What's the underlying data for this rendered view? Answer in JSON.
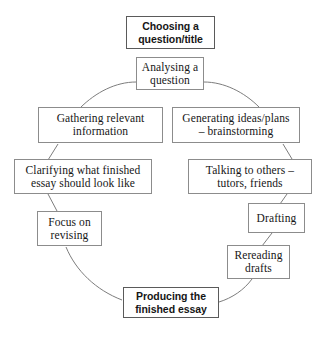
{
  "diagram": {
    "type": "cycle-flowchart",
    "background_color": "#ffffff",
    "box_border_color": "#8c8c8c",
    "arc_color": "#7d7d7d",
    "text_color": "#161616",
    "nodes": [
      {
        "id": "choosing-question-title",
        "label": "Choosing a\nquestion/title",
        "emphasis": true,
        "order": 1
      },
      {
        "id": "analysing-question",
        "label": "Analysing a\nquestion",
        "emphasis": false,
        "order": 2
      },
      {
        "id": "gathering-relevant-information",
        "label": "Gathering relevant\ninformation",
        "emphasis": false,
        "order": 3
      },
      {
        "id": "generating-ideas-plans",
        "label": "Generating ideas/plans\n– brainstorming",
        "emphasis": false,
        "order": 4
      },
      {
        "id": "clarifying-finished-essay",
        "label": "Clarifying what finished\nessay should look like",
        "emphasis": false,
        "order": 5
      },
      {
        "id": "talking-to-others",
        "label": "Talking to others –\ntutors, friends",
        "emphasis": false,
        "order": 6
      },
      {
        "id": "focus-on-revising",
        "label": "Focus on\nrevising",
        "emphasis": false,
        "order": 7
      },
      {
        "id": "drafting",
        "label": "Drafting",
        "emphasis": false,
        "order": 8
      },
      {
        "id": "rereading-drafts",
        "label": "Rereading\ndrafts",
        "emphasis": false,
        "order": 9
      },
      {
        "id": "producing-finished-essay",
        "label": "Producing the\nfinished essay",
        "emphasis": true,
        "order": 10
      }
    ],
    "connectors": [
      {
        "id": "analysing-to-gathering",
        "from": "analysing-question",
        "to": "gathering-relevant-information",
        "style": "arc"
      },
      {
        "id": "analysing-to-generating",
        "from": "analysing-question",
        "to": "generating-ideas-plans",
        "style": "arc"
      },
      {
        "id": "gathering-to-clarifying",
        "from": "gathering-relevant-information",
        "to": "clarifying-finished-essay",
        "style": "line"
      },
      {
        "id": "generating-to-talking",
        "from": "generating-ideas-plans",
        "to": "talking-to-others",
        "style": "line"
      },
      {
        "id": "clarifying-to-focus",
        "from": "clarifying-finished-essay",
        "to": "focus-on-revising",
        "style": "line"
      },
      {
        "id": "talking-to-drafting",
        "from": "talking-to-others",
        "to": "drafting",
        "style": "line"
      },
      {
        "id": "drafting-to-rereading",
        "from": "drafting",
        "to": "rereading-drafts",
        "style": "line"
      },
      {
        "id": "focus-to-producing",
        "from": "focus-on-revising",
        "to": "producing-finished-essay",
        "style": "arc"
      },
      {
        "id": "rereading-to-producing",
        "from": "rereading-drafts",
        "to": "producing-finished-essay",
        "style": "arc"
      }
    ]
  }
}
